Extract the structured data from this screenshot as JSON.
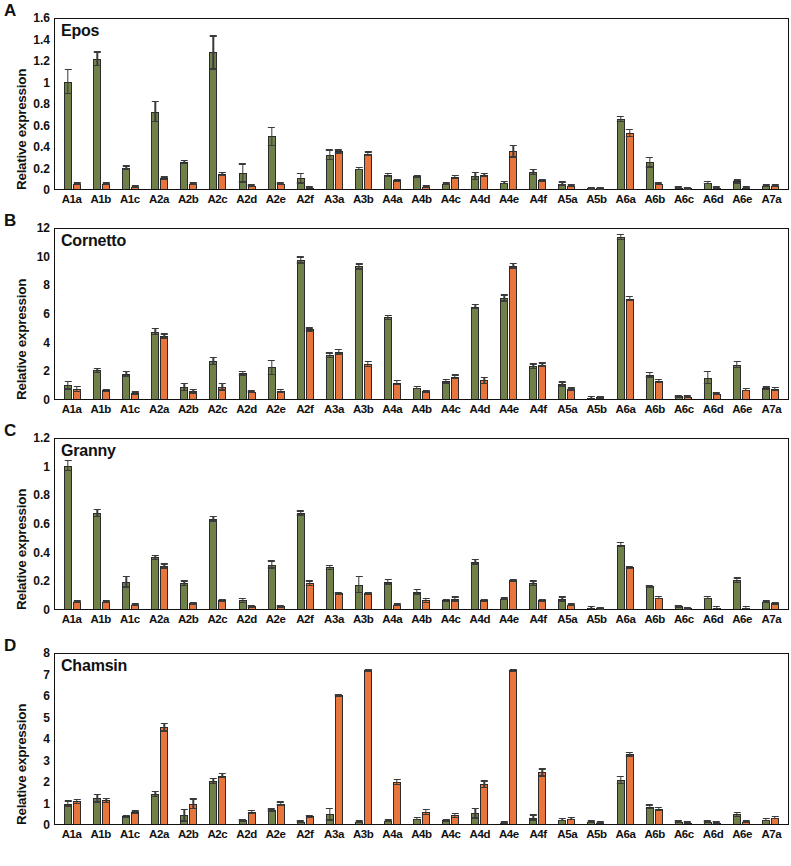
{
  "figure": {
    "ylabel": "Relative expression",
    "categories": [
      "A1a",
      "A1b",
      "A1c",
      "A2a",
      "A2b",
      "A2c",
      "A2d",
      "A2e",
      "A2f",
      "A3a",
      "A3b",
      "A4a",
      "A4b",
      "A4c",
      "A4d",
      "A4e",
      "A4f",
      "A5a",
      "A5b",
      "A6a",
      "A6b",
      "A6c",
      "A6d",
      "A6e",
      "A7a"
    ],
    "colors": {
      "series1": "#6f8049",
      "series2": "#e8763c",
      "axis": "#111111"
    },
    "panels": [
      {
        "letter": "A",
        "title": "Epos"
      },
      {
        "letter": "B",
        "title": "Cornetto"
      },
      {
        "letter": "C",
        "title": "Granny"
      },
      {
        "letter": "D",
        "title": "Chamsin"
      }
    ]
  },
  "chart_data": [
    {
      "type": "bar",
      "panel": "A",
      "title": "Epos",
      "xlabel": "",
      "ylabel": "Relative expression",
      "ylim": [
        0,
        1.6
      ],
      "yticks": [
        0,
        0.2,
        0.4,
        0.6,
        0.8,
        1,
        1.2,
        1.4,
        1.6
      ],
      "ytick_labels": [
        "0",
        "0.2",
        "0.4",
        "0.6",
        "0.8",
        "1",
        "1.2",
        "1.4",
        "1.6"
      ],
      "grid": false,
      "legend": "none",
      "categories": [
        "A1a",
        "A1b",
        "A1c",
        "A2a",
        "A2b",
        "A2c",
        "A2d",
        "A2e",
        "A2f",
        "A3a",
        "A3b",
        "A4a",
        "A4b",
        "A4c",
        "A4d",
        "A4e",
        "A4f",
        "A5a",
        "A5b",
        "A6a",
        "A6b",
        "A6c",
        "A6d",
        "A6e",
        "A7a"
      ],
      "series": [
        {
          "name": "series1",
          "color": "#6f8049",
          "values": [
            1.0,
            1.21,
            0.2,
            0.72,
            0.25,
            1.27,
            0.15,
            0.49,
            0.1,
            0.32,
            0.19,
            0.13,
            0.12,
            0.05,
            0.12,
            0.06,
            0.16,
            0.05,
            0.005,
            0.65,
            0.25,
            0.01,
            0.06,
            0.07,
            0.03
          ],
          "errors": [
            0.12,
            0.07,
            0.02,
            0.1,
            0.02,
            0.16,
            0.09,
            0.09,
            0.05,
            0.05,
            0.01,
            0.02,
            0.01,
            0.01,
            0.04,
            0.01,
            0.03,
            0.02,
            0.002,
            0.03,
            0.05,
            0.005,
            0.01,
            0.02,
            0.005
          ]
        },
        {
          "name": "series2",
          "color": "#e8763c",
          "values": [
            0.05,
            0.05,
            0.02,
            0.1,
            0.05,
            0.14,
            0.03,
            0.05,
            0.01,
            0.35,
            0.33,
            0.08,
            0.02,
            0.11,
            0.13,
            0.35,
            0.08,
            0.03,
            0.005,
            0.52,
            0.05,
            0.005,
            0.01,
            0.01,
            0.03
          ],
          "errors": [
            0.01,
            0.01,
            0.005,
            0.02,
            0.01,
            0.02,
            0.01,
            0.01,
            0.005,
            0.02,
            0.02,
            0.01,
            0.005,
            0.02,
            0.02,
            0.06,
            0.01,
            0.01,
            0.002,
            0.04,
            0.01,
            0.002,
            0.005,
            0.005,
            0.01
          ]
        }
      ]
    },
    {
      "type": "bar",
      "panel": "B",
      "title": "Cornetto",
      "xlabel": "",
      "ylabel": "Relative expression",
      "ylim": [
        0,
        12
      ],
      "yticks": [
        0,
        2,
        4,
        6,
        8,
        10,
        12
      ],
      "ytick_labels": [
        "0",
        "2",
        "4",
        "6",
        "8",
        "10",
        "12"
      ],
      "grid": false,
      "legend": "none",
      "categories": [
        "A1a",
        "A1b",
        "A1c",
        "A2a",
        "A2b",
        "A2c",
        "A2d",
        "A2e",
        "A2f",
        "A3a",
        "A3b",
        "A4a",
        "A4b",
        "A4c",
        "A4d",
        "A4e",
        "A4f",
        "A5a",
        "A5b",
        "A6a",
        "A6b",
        "A6c",
        "A6d",
        "A6e",
        "A7a"
      ],
      "series": [
        {
          "name": "series1",
          "color": "#6f8049",
          "values": [
            0.95,
            2.0,
            1.75,
            4.7,
            0.85,
            2.65,
            1.8,
            2.2,
            9.7,
            3.05,
            9.25,
            5.7,
            0.8,
            1.25,
            6.45,
            7.05,
            2.3,
            1.05,
            0.1,
            11.3,
            1.7,
            0.2,
            1.5,
            2.4,
            0.75
          ],
          "errors": [
            0.3,
            0.18,
            0.2,
            0.25,
            0.3,
            0.3,
            0.18,
            0.55,
            0.25,
            0.2,
            0.22,
            0.18,
            0.12,
            0.18,
            0.2,
            0.25,
            0.2,
            0.18,
            0.04,
            0.22,
            0.2,
            0.05,
            0.45,
            0.25,
            0.15
          ]
        },
        {
          "name": "series2",
          "color": "#e8763c",
          "values": [
            0.7,
            0.6,
            0.4,
            4.4,
            0.55,
            0.85,
            0.5,
            0.55,
            4.85,
            3.3,
            2.45,
            1.15,
            0.55,
            1.55,
            1.3,
            9.3,
            2.4,
            0.7,
            0.12,
            7.0,
            1.25,
            0.15,
            0.35,
            0.65,
            0.7
          ],
          "errors": [
            0.22,
            0.12,
            0.15,
            0.18,
            0.18,
            0.28,
            0.1,
            0.15,
            0.15,
            0.2,
            0.22,
            0.2,
            0.1,
            0.18,
            0.25,
            0.22,
            0.15,
            0.12,
            0.04,
            0.18,
            0.15,
            0.05,
            0.1,
            0.12,
            0.15
          ]
        }
      ]
    },
    {
      "type": "bar",
      "panel": "C",
      "title": "Granny",
      "xlabel": "",
      "ylabel": "Relative expression",
      "ylim": [
        0,
        1.2
      ],
      "yticks": [
        0,
        0.2,
        0.4,
        0.6,
        0.8,
        1,
        1.2
      ],
      "ytick_labels": [
        "0",
        "0.2",
        "0.4",
        "0.6",
        "0.8",
        "1",
        "1.2"
      ],
      "grid": false,
      "legend": "none",
      "categories": [
        "A1a",
        "A1b",
        "A1c",
        "A2a",
        "A2b",
        "A2c",
        "A2d",
        "A2e",
        "A2f",
        "A3a",
        "A3b",
        "A4a",
        "A4b",
        "A4c",
        "A4d",
        "A4e",
        "A4f",
        "A5a",
        "A5b",
        "A6a",
        "A6b",
        "A6c",
        "A6d",
        "A6e",
        "A7a"
      ],
      "series": [
        {
          "name": "series1",
          "color": "#6f8049",
          "values": [
            1.0,
            0.67,
            0.19,
            0.36,
            0.18,
            0.63,
            0.06,
            0.31,
            0.67,
            0.29,
            0.17,
            0.19,
            0.12,
            0.06,
            0.33,
            0.07,
            0.18,
            0.07,
            0.01,
            0.45,
            0.16,
            0.02,
            0.08,
            0.2,
            0.05
          ],
          "errors": [
            0.04,
            0.03,
            0.04,
            0.02,
            0.02,
            0.02,
            0.02,
            0.03,
            0.02,
            0.02,
            0.06,
            0.02,
            0.02,
            0.01,
            0.02,
            0.01,
            0.02,
            0.02,
            0.004,
            0.02,
            0.01,
            0.005,
            0.01,
            0.02,
            0.01
          ]
        },
        {
          "name": "series2",
          "color": "#e8763c",
          "values": [
            0.05,
            0.05,
            0.03,
            0.3,
            0.04,
            0.06,
            0.02,
            0.02,
            0.18,
            0.11,
            0.11,
            0.03,
            0.06,
            0.07,
            0.06,
            0.2,
            0.06,
            0.03,
            0.005,
            0.29,
            0.08,
            0.005,
            0.01,
            0.01,
            0.04
          ],
          "errors": [
            0.01,
            0.01,
            0.005,
            0.02,
            0.01,
            0.01,
            0.005,
            0.005,
            0.02,
            0.01,
            0.01,
            0.01,
            0.02,
            0.02,
            0.01,
            0.01,
            0.01,
            0.01,
            0.002,
            0.01,
            0.01,
            0.002,
            0.005,
            0.005,
            0.01
          ]
        }
      ]
    },
    {
      "type": "bar",
      "panel": "D",
      "title": "Chamsin",
      "xlabel": "",
      "ylabel": "Relative expression",
      "ylim": [
        0,
        8
      ],
      "yticks": [
        0,
        1,
        2,
        3,
        4,
        5,
        6,
        7,
        8
      ],
      "ytick_labels": [
        "0",
        "1",
        "2",
        "3",
        "4",
        "5",
        "6",
        "7",
        "8"
      ],
      "grid": false,
      "legend": "none",
      "categories": [
        "A1a",
        "A1b",
        "A1c",
        "A2a",
        "A2b",
        "A2c",
        "A2d",
        "A2e",
        "A2f",
        "A3a",
        "A3b",
        "A4a",
        "A4b",
        "A4c",
        "A4d",
        "A4e",
        "A4f",
        "A5a",
        "A5b",
        "A6a",
        "A6b",
        "A6c",
        "A6d",
        "A6e",
        "A7a"
      ],
      "series": [
        {
          "name": "series1",
          "color": "#6f8049",
          "values": [
            0.95,
            1.2,
            0.35,
            1.4,
            0.4,
            2.0,
            0.18,
            0.65,
            0.1,
            0.45,
            0.1,
            0.15,
            0.25,
            0.18,
            0.5,
            0.05,
            0.3,
            0.2,
            0.1,
            2.05,
            0.8,
            0.1,
            0.1,
            0.45,
            0.2
          ],
          "errors": [
            0.15,
            0.2,
            0.08,
            0.15,
            0.3,
            0.15,
            0.05,
            0.08,
            0.04,
            0.3,
            0.04,
            0.05,
            0.08,
            0.06,
            0.25,
            0.03,
            0.15,
            0.08,
            0.05,
            0.2,
            0.12,
            0.04,
            0.04,
            0.12,
            0.08
          ]
        },
        {
          "name": "series2",
          "color": "#e8763c",
          "values": [
            1.05,
            1.1,
            0.55,
            4.5,
            0.95,
            2.25,
            0.55,
            0.95,
            0.35,
            6.0,
            7.15,
            1.95,
            0.55,
            0.4,
            1.85,
            7.15,
            2.4,
            0.25,
            0.05,
            3.25,
            0.7,
            0.05,
            0.05,
            0.1,
            0.3
          ],
          "errors": [
            0.12,
            0.12,
            0.08,
            0.2,
            0.25,
            0.12,
            0.1,
            0.1,
            0.08,
            0.05,
            0.05,
            0.15,
            0.15,
            0.12,
            0.18,
            0.08,
            0.2,
            0.08,
            0.03,
            0.12,
            0.1,
            0.02,
            0.02,
            0.04,
            0.08
          ]
        }
      ]
    }
  ]
}
